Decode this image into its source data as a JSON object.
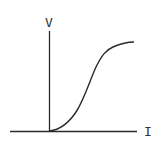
{
  "diagram": {
    "y_axis_label": "V",
    "x_axis_label": "I",
    "curve": "S-shaped V-I characteristic starting at origin and saturating",
    "colors": {
      "line": "#2a2a2a",
      "background": "#ffffff"
    }
  }
}
